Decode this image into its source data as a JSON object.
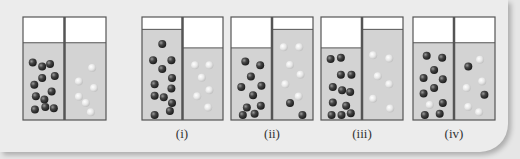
{
  "figure": {
    "panels": [
      {
        "id": "initial",
        "label": "",
        "left_level": 0.75,
        "right_level": 0.75,
        "left_dark": [
          [
            0.15,
            0.22
          ],
          [
            0.45,
            0.28
          ],
          [
            0.7,
            0.24
          ],
          [
            0.45,
            0.45
          ],
          [
            0.85,
            0.42
          ],
          [
            0.2,
            0.55
          ],
          [
            0.75,
            0.65
          ],
          [
            0.25,
            0.72
          ],
          [
            0.52,
            0.77
          ],
          [
            0.22,
            0.92
          ],
          [
            0.55,
            0.88
          ],
          [
            0.82,
            0.9
          ]
        ],
        "left_light": [],
        "right_dark": [],
        "right_light": [
          [
            0.72,
            0.3
          ],
          [
            0.3,
            0.5
          ],
          [
            0.78,
            0.6
          ],
          [
            0.3,
            0.73
          ],
          [
            0.52,
            0.82
          ],
          [
            0.68,
            0.96
          ]
        ]
      },
      {
        "id": "i",
        "label": "(i)",
        "left_level": 0.88,
        "right_level": 0.7,
        "left_dark": [
          [
            0.5,
            0.12
          ],
          [
            0.2,
            0.32
          ],
          [
            0.8,
            0.32
          ],
          [
            0.5,
            0.43
          ],
          [
            0.82,
            0.54
          ],
          [
            0.25,
            0.62
          ],
          [
            0.8,
            0.67
          ],
          [
            0.25,
            0.76
          ],
          [
            0.55,
            0.78
          ],
          [
            0.82,
            0.85
          ],
          [
            0.75,
            0.95
          ],
          [
            0.25,
            1.0
          ]
        ],
        "left_light": [],
        "right_dark": [],
        "right_light": [
          [
            0.25,
            0.2
          ],
          [
            0.72,
            0.2
          ],
          [
            0.47,
            0.4
          ],
          [
            0.72,
            0.6
          ],
          [
            0.32,
            0.7
          ],
          [
            0.68,
            0.88
          ]
        ]
      },
      {
        "id": "ii",
        "label": "(ii)",
        "left_level": 0.7,
        "right_level": 0.88,
        "left_dark": [
          [
            0.3,
            0.14
          ],
          [
            0.78,
            0.2
          ],
          [
            0.48,
            0.38
          ],
          [
            0.17,
            0.55
          ],
          [
            0.82,
            0.53
          ],
          [
            0.55,
            0.68
          ],
          [
            0.35,
            0.88
          ],
          [
            0.8,
            0.85
          ],
          [
            0.6,
            0.98
          ],
          [
            0.22,
            1.0
          ]
        ],
        "left_light": [],
        "right_dark": [
          [
            0.42,
            0.85
          ],
          [
            0.82,
            1.0
          ]
        ],
        "right_light": [
          [
            0.22,
            0.16
          ],
          [
            0.72,
            0.16
          ],
          [
            0.42,
            0.38
          ],
          [
            0.76,
            0.5
          ],
          [
            0.27,
            0.62
          ],
          [
            0.7,
            0.77
          ]
        ]
      },
      {
        "id": "iii",
        "label": "(iii)",
        "left_level": 0.7,
        "right_level": 0.88,
        "left_dark": [
          [
            0.15,
            0.1
          ],
          [
            0.48,
            0.08
          ],
          [
            0.48,
            0.35
          ],
          [
            0.82,
            0.35
          ],
          [
            0.22,
            0.55
          ],
          [
            0.52,
            0.6
          ],
          [
            0.78,
            0.63
          ],
          [
            0.22,
            0.8
          ],
          [
            0.65,
            0.85
          ],
          [
            0.18,
            1.0
          ],
          [
            0.5,
            1.0
          ],
          [
            0.8,
            0.97
          ]
        ],
        "left_light": [],
        "right_dark": [],
        "right_light": [
          [
            0.2,
            0.26
          ],
          [
            0.72,
            0.3
          ],
          [
            0.35,
            0.52
          ],
          [
            0.72,
            0.62
          ],
          [
            0.2,
            0.8
          ],
          [
            0.75,
            0.92
          ]
        ]
      },
      {
        "id": "iv",
        "label": "(iv)",
        "left_level": 0.75,
        "right_level": 0.75,
        "left_dark": [
          [
            0.28,
            0.12
          ],
          [
            0.78,
            0.15
          ],
          [
            0.52,
            0.33
          ],
          [
            0.18,
            0.45
          ],
          [
            0.8,
            0.47
          ],
          [
            0.52,
            0.6
          ],
          [
            0.18,
            0.68
          ],
          [
            0.8,
            0.82
          ],
          [
            0.7,
            0.98
          ],
          [
            0.22,
            1.0
          ]
        ],
        "left_light": [
          [
            0.38,
            0.85
          ]
        ],
        "right_dark": [
          [
            0.3,
            0.28
          ],
          [
            0.82,
            0.7
          ]
        ],
        "right_light": [
          [
            0.68,
            0.18
          ],
          [
            0.75,
            0.5
          ],
          [
            0.25,
            0.6
          ],
          [
            0.3,
            0.88
          ],
          [
            0.65,
            0.96
          ]
        ]
      }
    ],
    "colors": {
      "liquid": "#d3d3d3",
      "empty": "#ffffff",
      "border": "#555555",
      "dark_particle": "#3a3a3a",
      "light_particle": "#e8e8e8"
    }
  }
}
